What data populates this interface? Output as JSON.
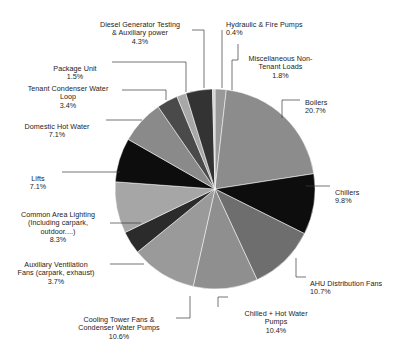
{
  "chart_data": {
    "type": "pie",
    "title": "",
    "subtitle": "",
    "xlabel": "",
    "ylabel": "",
    "legend_position": "none",
    "grid": false,
    "units": "percent",
    "start_angle_deg": 0,
    "direction": "clockwise",
    "total": 100.0,
    "categories": [
      "Miscellaneous Non-Tenant Loads",
      "Boilers",
      "Chillers",
      "AHU Distribution Fans",
      "Chilled + Hot Water Pumps",
      "Cooling Tower Fans & Condenser Water Pumps",
      "Auxiliary Ventilation Fans (carpark, exhaust)",
      "Common Area Lighting (Including carpark, outdoor....)",
      "Lifts",
      "Domestic Hot Water",
      "Tenant Condenser Water Loop",
      "Package Unit",
      "Diesel Generator Testing & Auxiliary power",
      "Hydraulic & Fire Pumps"
    ],
    "values": [
      1.8,
      20.7,
      9.8,
      10.7,
      10.4,
      10.6,
      3.7,
      8.3,
      7.1,
      7.1,
      3.4,
      1.5,
      4.3,
      0.4
    ],
    "colors": [
      "#999999",
      "#8c8c8c",
      "#0d0d0d",
      "#6e6e6e",
      "#8f8f8f",
      "#9a9a9a",
      "#2b2b2b",
      "#a6a6a6",
      "#0d0d0d",
      "#8a8a8a",
      "#4a4a4a",
      "#a8a8a8",
      "#333333",
      "#cfcfcf"
    ],
    "slices": [
      {
        "label": "Miscellaneous Non-Tenant Loads",
        "value": 1.8,
        "pct_text": "1.8%",
        "color": "#999999"
      },
      {
        "label": "Boilers",
        "value": 20.7,
        "pct_text": "20.7%",
        "color": "#8c8c8c"
      },
      {
        "label": "Chillers",
        "value": 9.8,
        "pct_text": "9.8%",
        "color": "#0d0d0d"
      },
      {
        "label": "AHU Distribution Fans",
        "value": 10.7,
        "pct_text": "10.7%",
        "color": "#6e6e6e"
      },
      {
        "label": "Chilled + Hot Water Pumps",
        "value": 10.4,
        "pct_text": "10.4%",
        "color": "#8f8f8f"
      },
      {
        "label": "Cooling Tower Fans & Condenser Water Pumps",
        "value": 10.6,
        "pct_text": "10.6%",
        "color": "#9a9a9a"
      },
      {
        "label": "Auxiliary Ventilation Fans (carpark, exhaust)",
        "value": 3.7,
        "pct_text": "3.7%",
        "color": "#2b2b2b"
      },
      {
        "label": "Common Area Lighting (Including carpark, outdoor....)",
        "value": 8.3,
        "pct_text": "8.3%",
        "color": "#a6a6a6"
      },
      {
        "label": "Lifts",
        "value": 7.1,
        "pct_text": "7.1%",
        "color": "#0d0d0d"
      },
      {
        "label": "Domestic Hot Water",
        "value": 7.1,
        "pct_text": "7.1%",
        "color": "#8a8a8a"
      },
      {
        "label": "Tenant Condenser Water Loop",
        "value": 3.4,
        "pct_text": "3.4%",
        "color": "#4a4a4a"
      },
      {
        "label": "Package Unit",
        "value": 1.5,
        "pct_text": "1.5%",
        "color": "#a8a8a8"
      },
      {
        "label": "Diesel Generator Testing & Auxiliary power",
        "value": 4.3,
        "pct_text": "4.3%",
        "color": "#333333"
      },
      {
        "label": "Hydraulic & Fire Pumps",
        "value": 0.4,
        "pct_text": "0.4%",
        "color": "#cfcfcf"
      }
    ]
  },
  "labels": {
    "hydraulic_fire_pumps": {
      "name": "Hydraulic & Fire Pumps",
      "pct": "0.4%"
    },
    "misc_non_tenant": {
      "name": "Miscellaneous Non-\nTenant Loads",
      "pct": "1.8%"
    },
    "boilers": {
      "name": "Boilers",
      "pct": "20.7%"
    },
    "chillers": {
      "name": "Chillers",
      "pct": "9.8%"
    },
    "ahu_distribution_fans": {
      "name": "AHU Distribution Fans",
      "pct": "10.7%"
    },
    "chilled_hot_water_pumps": {
      "name": "Chilled + Hot Water\nPumps",
      "pct": "10.4%"
    },
    "cooling_tower_fans": {
      "name": "Cooling Tower Fans &\nCondenser Water Pumps",
      "pct": "10.6%"
    },
    "auxiliary_ventilation_fans": {
      "name": "Auxiliary Ventilation\nFans (carpark, exhaust)",
      "pct": "3.7%"
    },
    "common_area_lighting": {
      "name": "Common Area Lighting\n(Including carpark,\noutdoor....)",
      "pct": "8.3%"
    },
    "lifts": {
      "name": "Lifts",
      "pct": "7.1%"
    },
    "domestic_hot_water": {
      "name": "Domestic Hot Water",
      "pct": "7.1%"
    },
    "tenant_condenser_water_loop": {
      "name": "Tenant Condenser Water\nLoop",
      "pct": "3.4%"
    },
    "package_unit": {
      "name": "Package Unit",
      "pct": "1.5%"
    },
    "diesel_generator": {
      "name": "Diesel Generator Testing\n& Auxiliary power",
      "pct": "4.3%"
    }
  }
}
